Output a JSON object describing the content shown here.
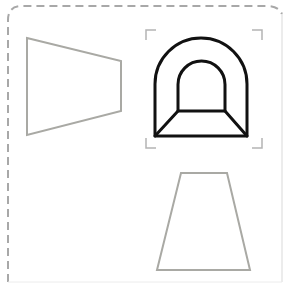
{
  "diagram": {
    "colors": {
      "background": "#ffffff",
      "frame": "#a8a8a8",
      "shape_outline": "#a9a9a4",
      "icon_stroke": "#111111",
      "selection_bracket": "#b4b4b4"
    },
    "frame": {
      "style": "dashed-left-top, rounded corners",
      "x": 7,
      "y": 6,
      "width": 278,
      "height": 275,
      "radius": 14
    },
    "shapes": [
      {
        "id": "left-trapezoid",
        "type": "polygon",
        "points": "27,38 121,61 121,111 27,135"
      },
      {
        "id": "tunnel-icon",
        "type": "tunnel",
        "outer_arch": {
          "left": 155,
          "right": 247,
          "top": 38,
          "bottom": 136
        },
        "inner_arch": {
          "left": 178,
          "right": 225,
          "top": 61,
          "bottom": 111
        },
        "selected": true
      },
      {
        "id": "bottom-trapezoid",
        "type": "polygon",
        "points": "181,173 227,173 250,270 157,270"
      }
    ],
    "selection_box": {
      "left": 146,
      "top": 29,
      "right": 262,
      "bottom": 149,
      "arm": 10
    }
  }
}
